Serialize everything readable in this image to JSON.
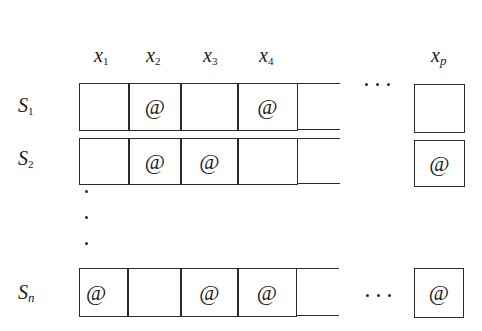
{
  "columns": [
    {
      "name": "x",
      "sub": "1"
    },
    {
      "name": "x",
      "sub": "2"
    },
    {
      "name": "x",
      "sub": "3"
    },
    {
      "name": "x",
      "sub": "4"
    },
    {
      "name": "x",
      "sub": "p"
    }
  ],
  "rows": [
    {
      "name": "S",
      "sub": "1",
      "cells": [
        "",
        "@",
        "",
        "@",
        ""
      ],
      "last": ""
    },
    {
      "name": "S",
      "sub": "2",
      "cells": [
        "",
        "@",
        "@",
        "",
        ""
      ],
      "last": "@"
    },
    {
      "name": "S",
      "sub": "n",
      "cells": [
        "@",
        "",
        "@",
        "@",
        ""
      ],
      "last": "@"
    }
  ],
  "ellipsis": "· · ·",
  "marker": "@"
}
